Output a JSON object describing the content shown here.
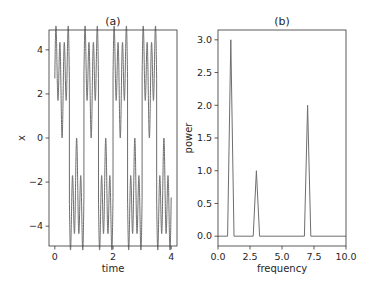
{
  "chart_data": [
    {
      "type": "line",
      "title": "(a)",
      "xlabel": "time",
      "ylabel": "x",
      "xlim": [
        -0.2,
        4.2
      ],
      "ylim": [
        -4.9,
        4.9
      ],
      "xticks": [
        0,
        2,
        4
      ],
      "xtick_labels": [
        "0",
        "2",
        "4"
      ],
      "yticks": [
        4,
        2,
        0,
        -2,
        -4
      ],
      "ytick_labels": [
        "4",
        "2",
        "0",
        "−2",
        "−4"
      ],
      "grid": false,
      "line_color": "#6e6e6e",
      "description": "Square wave of amplitude 3 (period 1) plus sinusoids at frequencies 3 and 7; signal oscillates between about -4.5 and 4.5 over time 0 to 4",
      "series": [
        {
          "name": "x(t)",
          "components": [
            {
              "type": "square",
              "frequency": 1,
              "amplitude": 3
            },
            {
              "type": "sine",
              "frequency": 3,
              "amplitude": 1
            },
            {
              "type": "sine",
              "frequency": 7,
              "amplitude": 2
            }
          ],
          "x_range": [
            0,
            4
          ]
        }
      ]
    },
    {
      "type": "line",
      "title": "(b)",
      "xlabel": "frequency",
      "ylabel": "power",
      "xlim": [
        0,
        10
      ],
      "ylim": [
        -0.15,
        3.15
      ],
      "xticks": [
        0,
        2.5,
        5,
        7.5,
        10
      ],
      "xtick_labels": [
        "0.0",
        "2.5",
        "5.0",
        "7.5",
        "10.0"
      ],
      "yticks": [
        0,
        0.5,
        1,
        1.5,
        2,
        2.5,
        3
      ],
      "ytick_labels": [
        "0.0",
        "0.5",
        "1.0",
        "1.5",
        "2.0",
        "2.5",
        "3.0"
      ],
      "grid": false,
      "line_color": "#6e6e6e",
      "series": [
        {
          "name": "power",
          "x": [
            0,
            0.75,
            1.0,
            1.25,
            2.75,
            3.0,
            3.25,
            6.75,
            7.0,
            7.25,
            10
          ],
          "y": [
            0,
            0,
            3.0,
            0,
            0,
            1.0,
            0,
            0,
            2.0,
            0,
            0
          ]
        }
      ]
    }
  ]
}
